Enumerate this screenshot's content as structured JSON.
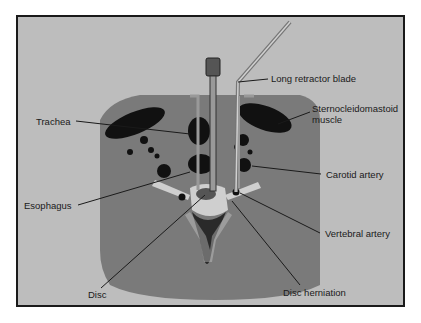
{
  "figure": {
    "colors": {
      "background": "#bdbdbd",
      "neck_tissue": "#7a7a7a",
      "structures": "#111111",
      "bone": "#cfcfcf",
      "frame": "#1a1a1a"
    }
  },
  "labels": {
    "long_retractor_blade": "Long retractor blade",
    "sternocleidomastoid_line1": "Sternocleidomastoid",
    "sternocleidomastoid_line2": "muscle",
    "trachea": "Trachea",
    "carotid_artery": "Carotid artery",
    "esophagus": "Esophagus",
    "vertebral_artery": "Vertebral artery",
    "disc": "Disc",
    "disc_herniation": "Disc herniation"
  }
}
